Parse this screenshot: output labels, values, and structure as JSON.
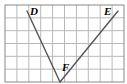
{
  "figure": {
    "kind": "geometry-grid-diagram",
    "width": 127,
    "height": 84,
    "background_color": "#ffffff",
    "grid": {
      "columns": 10,
      "rows": 6,
      "left": 5,
      "top": 5,
      "right": 124,
      "bottom": 82,
      "cell_width": 11.9,
      "cell_height": 12.83,
      "line_color": "#b9b9b9",
      "border_color": "#888888",
      "border_width": 1
    },
    "segment_color": "#555555",
    "segment_width": 1.4,
    "points": [
      {
        "id": "D",
        "label": "D",
        "x": 27,
        "y": 11,
        "label_x": 30,
        "label_y": 6
      },
      {
        "id": "E",
        "label": "E",
        "x": 118,
        "y": 11,
        "label_x": 104,
        "label_y": 6
      },
      {
        "id": "F",
        "label": "F",
        "x": 60,
        "y": 82,
        "label_x": 62,
        "label_y": 62
      }
    ],
    "segments": [
      {
        "id": "DF",
        "from": "D",
        "to": "F",
        "x1": 27,
        "y1": 11,
        "x2": 60,
        "y2": 82
      },
      {
        "id": "FE",
        "from": "F",
        "to": "E",
        "x1": 60,
        "y1": 82,
        "x2": 118,
        "y2": 11
      }
    ]
  }
}
